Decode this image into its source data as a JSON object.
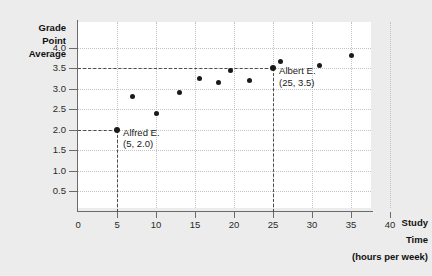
{
  "chart_data": {
    "type": "scatter",
    "title": "",
    "xlabel": "Study Time (hours per week)",
    "ylabel": "Grade Point Average",
    "ylabel_lines": [
      "Grade",
      "Point",
      "Average"
    ],
    "xlabel_lines": [
      "Study",
      "Time",
      "(hours per week)"
    ],
    "xlim": [
      0,
      42
    ],
    "ylim": [
      0,
      4.35
    ],
    "grid": true,
    "legend": "none",
    "x_ticks": [
      {
        "value": 0,
        "label": "0"
      },
      {
        "value": 5,
        "label": "5"
      },
      {
        "value": 10,
        "label": "10"
      },
      {
        "value": 15,
        "label": "15"
      },
      {
        "value": 20,
        "label": "20"
      },
      {
        "value": 25,
        "label": "25"
      },
      {
        "value": 30,
        "label": "30"
      },
      {
        "value": 35,
        "label": "35"
      },
      {
        "value": 40,
        "label": "40"
      }
    ],
    "y_ticks": [
      {
        "value": 0.5,
        "label": "0.5"
      },
      {
        "value": 1.0,
        "label": "1.0"
      },
      {
        "value": 1.5,
        "label": "1.5"
      },
      {
        "value": 2.0,
        "label": "2.0"
      },
      {
        "value": 2.5,
        "label": "2.5"
      },
      {
        "value": 3.0,
        "label": "3.0"
      },
      {
        "value": 3.5,
        "label": "3.5"
      },
      {
        "value": 4.0,
        "label": "4.0"
      }
    ],
    "points": [
      {
        "x": 5,
        "y": 2.0,
        "highlight": true
      },
      {
        "x": 7,
        "y": 2.8,
        "highlight": false
      },
      {
        "x": 10,
        "y": 2.4,
        "highlight": false
      },
      {
        "x": 13,
        "y": 2.9,
        "highlight": false
      },
      {
        "x": 15.5,
        "y": 3.25,
        "highlight": false
      },
      {
        "x": 18,
        "y": 3.15,
        "highlight": false
      },
      {
        "x": 19.5,
        "y": 3.45,
        "highlight": false
      },
      {
        "x": 22,
        "y": 3.2,
        "highlight": false
      },
      {
        "x": 25,
        "y": 3.5,
        "highlight": true
      },
      {
        "x": 26,
        "y": 3.65,
        "highlight": false
      },
      {
        "x": 31,
        "y": 3.55,
        "highlight": false
      },
      {
        "x": 35,
        "y": 3.8,
        "highlight": false
      }
    ],
    "annotations": [
      {
        "name": "alfred",
        "label_line1": "Alfred E.",
        "label_line2": "(5, 2.0)",
        "x": 5,
        "y": 2.0
      },
      {
        "name": "albert",
        "label_line1": "Albert E.",
        "label_line2": "(25, 3.5)",
        "x": 25,
        "y": 3.5
      }
    ],
    "colors": {
      "background": "#ececec",
      "plot_background": "#ffffff",
      "axis": "#6b6b6b",
      "grid": "#c3c3c3",
      "point": "#1a1a1a",
      "guide": "#4a4a4a",
      "text": "#1a1a1a"
    }
  }
}
